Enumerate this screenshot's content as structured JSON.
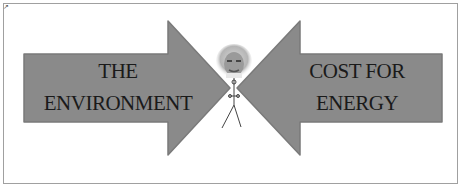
{
  "diagram": {
    "left_arrow": {
      "line1": "THE",
      "line2": "ENVIRONMENT",
      "direction": "right",
      "fill": "#8a8a8a"
    },
    "right_arrow": {
      "line1": "COST FOR",
      "line2": "ENERGY",
      "direction": "left",
      "fill": "#8a8a8a"
    },
    "center_figure": "stick-figure-with-photo-head",
    "text_color": "#1a1a1a",
    "border_color": "#a0a0a0"
  }
}
